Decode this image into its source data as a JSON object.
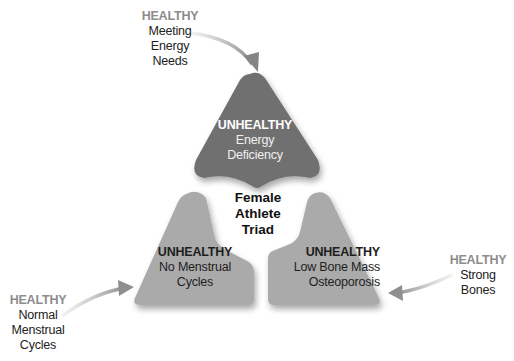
{
  "diagram": {
    "title": [
      "Female",
      "Athlete",
      "Triad"
    ],
    "colors": {
      "top_shape": "#6f6f6f",
      "bottom_shapes": "#aaaaaa",
      "arrow": "#8f8f8f",
      "healthy_label": "#8c8c8c"
    },
    "unhealthy": [
      {
        "heading": "UNHEALTHY",
        "lines": [
          "Energy",
          "Deficiency"
        ]
      },
      {
        "heading": "UNHEALTHY",
        "lines": [
          "No Menstrual",
          "Cycles"
        ]
      },
      {
        "heading": "UNHEALTHY",
        "lines": [
          "Low Bone Mass",
          "Osteoporosis"
        ]
      }
    ],
    "healthy": [
      {
        "heading": "HEALTHY",
        "lines": [
          "Meeting",
          "Energy",
          "Needs"
        ]
      },
      {
        "heading": "HEALTHY",
        "lines": [
          "Normal",
          "Menstrual",
          "Cycles"
        ]
      },
      {
        "heading": "HEALTHY",
        "lines": [
          "Strong",
          "Bones"
        ]
      }
    ]
  }
}
